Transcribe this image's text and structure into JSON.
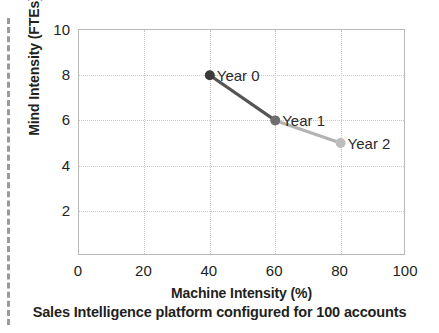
{
  "figure": {
    "caption": "Sales Intelligence platform configured for 100 accounts"
  },
  "chart_data": {
    "type": "line",
    "title": "",
    "subtitle": "",
    "xlabel": "Machine Intensity (%)",
    "ylabel": "Mind Intensity (FTEs)",
    "xlim": [
      0,
      100
    ],
    "ylim": [
      0,
      10
    ],
    "xticks": [
      0,
      20,
      40,
      60,
      80,
      100
    ],
    "xtick_labels": [
      "0",
      "20",
      "40",
      "60",
      "80",
      "100"
    ],
    "yticks": [
      0,
      2,
      4,
      6,
      8,
      10
    ],
    "ytick_labels": [
      "0",
      "2",
      "4",
      "6",
      "8",
      "10"
    ],
    "grid": true,
    "grid_style": "dotted",
    "legend": "none",
    "annotations": [
      "Year 0",
      "Year 1",
      "Year 2"
    ],
    "series": [
      {
        "name": "Mind Intensity trajectory",
        "x": [
          40,
          60,
          80
        ],
        "y": [
          8,
          6,
          5
        ],
        "point_labels": [
          "Year 0",
          "Year 1",
          "Year 2"
        ],
        "point_colors": [
          "#3a3a3a",
          "#6f6f6f",
          "#bdbdbd"
        ],
        "segment_colors": [
          "#555555",
          "#b3b3b3"
        ]
      }
    ],
    "colors": {
      "axis": "#b9b9b9",
      "grid": "#c9c9c9",
      "text": "#231f20",
      "dark_marker": "#3a3a3a",
      "mid_marker": "#6f6f6f",
      "light_marker": "#bdbdbd",
      "dark_segment": "#555555",
      "light_segment": "#b3b3b3",
      "margin_rule": "#9a9a9a",
      "background": "#ffffff"
    }
  }
}
